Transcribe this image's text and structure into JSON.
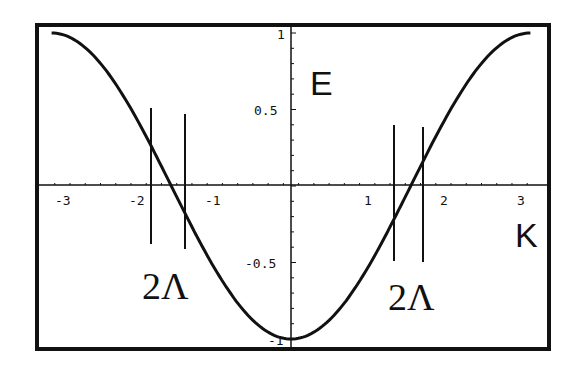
{
  "chart_data": {
    "type": "line",
    "title": "",
    "xlabel": "K",
    "ylabel": "E",
    "function": "E = -cos(K)",
    "xlim": [
      -3.14159,
      3.14159
    ],
    "ylim": [
      -1,
      1
    ],
    "x_ticks": [
      "-3",
      "-2",
      "-1",
      "1",
      "2",
      "3"
    ],
    "y_ticks": [
      "1",
      "0.5",
      "-0.5",
      "-1"
    ],
    "series": [
      {
        "name": "E(K)",
        "x": [
          -3.14,
          -2.5,
          -2,
          -1.5,
          -1,
          -0.5,
          0,
          0.5,
          1,
          1.5,
          2,
          2.5,
          3.14
        ],
        "values": [
          1.0,
          0.8,
          0.42,
          -0.07,
          -0.54,
          -0.88,
          -1.0,
          -0.88,
          -0.54,
          -0.07,
          0.42,
          0.8,
          1.0
        ]
      }
    ],
    "annotations": [
      {
        "type": "vline",
        "x": -1.84
      },
      {
        "type": "vline",
        "x": -1.39
      },
      {
        "type": "vline",
        "x": 1.34
      },
      {
        "type": "vline",
        "x": 1.72
      },
      {
        "type": "text",
        "text": "2Λ",
        "near_x": -1.6
      },
      {
        "type": "text",
        "text": "2Λ",
        "near_x": 1.55
      }
    ],
    "grid": false,
    "legend": "none"
  },
  "labels": {
    "e_axis": "E",
    "k_axis": "K",
    "lambda_left": "2Λ",
    "lambda_right": "2Λ",
    "xt": [
      "-3",
      "-2",
      "-1",
      "1",
      "2",
      "3"
    ],
    "yt": [
      "1",
      "0.5",
      "-0.5",
      "-1"
    ]
  }
}
